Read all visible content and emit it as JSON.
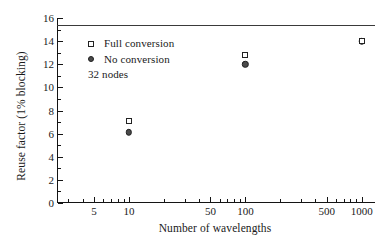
{
  "chart_data": {
    "type": "scatter",
    "title": "",
    "xlabel": "Number of wavelengths",
    "ylabel": "Reuse factor (1% blocking)",
    "xscale": "log",
    "xlim": [
      2.4,
      1300
    ],
    "ylim": [
      0,
      16
    ],
    "grid": false,
    "legend_position": "upper-left",
    "annotations": [
      "32 nodes"
    ],
    "xticks_major": [
      5,
      10,
      50,
      100,
      500,
      1000
    ],
    "xtick_labels": [
      "5",
      "10",
      "50",
      "100",
      "500",
      "1000"
    ],
    "yticks_major": [
      0,
      2,
      4,
      6,
      8,
      10,
      12,
      14,
      16
    ],
    "ytick_labels": [
      "0",
      "2",
      "4",
      "6",
      "8",
      "10",
      "12",
      "14",
      "16"
    ],
    "series": [
      {
        "name": "Full conversion",
        "marker": "open-square",
        "x": [
          10,
          100,
          1000
        ],
        "values": [
          7.1,
          12.8,
          14.0
        ]
      },
      {
        "name": "No conversion",
        "marker": "filled-circle",
        "x": [
          10,
          100,
          1000
        ],
        "values": [
          6.1,
          12.0,
          14.0
        ]
      }
    ],
    "reference_lines": [
      {
        "name": "upper-bound",
        "orientation": "horizontal",
        "value": 15.4
      }
    ]
  },
  "legend": {
    "items": [
      {
        "label": "Full conversion",
        "marker": "open-square"
      },
      {
        "label": "No conversion",
        "marker": "filled-circle"
      }
    ],
    "note": "32 nodes"
  }
}
